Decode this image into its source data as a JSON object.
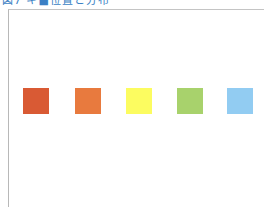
{
  "figure": {
    "title": "図7 キ■位置と分布"
  },
  "swatches": [
    {
      "name": "red-orange",
      "color": "#d95a34",
      "x": 23
    },
    {
      "name": "orange",
      "color": "#e87a3e",
      "x": 75
    },
    {
      "name": "yellow",
      "color": "#fcfc60",
      "x": 126
    },
    {
      "name": "green",
      "color": "#a8d26c",
      "x": 177
    },
    {
      "name": "light-blue",
      "color": "#92ccf2",
      "x": 227
    }
  ]
}
